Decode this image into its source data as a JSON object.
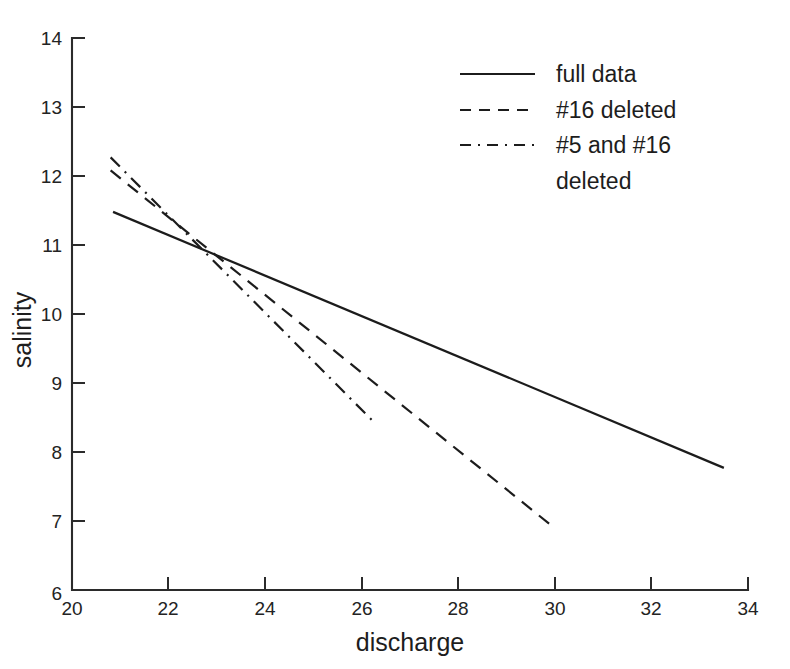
{
  "chart_data": {
    "type": "line",
    "title": "",
    "xlabel": "discharge",
    "ylabel": "salinity",
    "xlim": [
      20,
      34
    ],
    "ylim": [
      6,
      14
    ],
    "xticks": [
      20,
      22,
      24,
      26,
      28,
      30,
      32,
      34
    ],
    "yticks": [
      6,
      7,
      8,
      9,
      10,
      11,
      12,
      13,
      14
    ],
    "xtick_labels": [
      "20",
      "22",
      "24",
      "26",
      "28",
      "30",
      "32",
      "34"
    ],
    "ytick_labels": [
      "6",
      "7",
      "8",
      "9",
      "10",
      "11",
      "12",
      "13",
      "14"
    ],
    "grid": false,
    "legend_position": "upper right",
    "line_color": "#1c1c1c",
    "axis_color": "#2b2b2b",
    "background_color": "#ffffff",
    "series": [
      {
        "name": "full data",
        "style": "solid",
        "x": [
          20.85,
          33.5
        ],
        "y": [
          11.48,
          7.77
        ]
      },
      {
        "name": "#16 deleted",
        "style": "dashed",
        "x": [
          20.8,
          29.9
        ],
        "y": [
          12.08,
          6.95
        ]
      },
      {
        "name": "#5 and #16 deleted",
        "style": "dashdot",
        "x": [
          20.8,
          26.3
        ],
        "y": [
          12.27,
          8.4
        ]
      }
    ],
    "annotations": [
      {
        "name": "convergence-point",
        "x": 23.0,
        "y": 10.71,
        "note": "all three regression lines intersect"
      }
    ]
  },
  "legend": {
    "entries": [
      {
        "label": "full data",
        "style": "solid"
      },
      {
        "label": "#16 deleted",
        "style": "dashed"
      },
      {
        "label": "#5 and #16",
        "style": "dashdot"
      }
    ],
    "wrapped_continuation": "deleted"
  },
  "axes": {
    "x_title": "discharge",
    "y_title": "salinity"
  }
}
